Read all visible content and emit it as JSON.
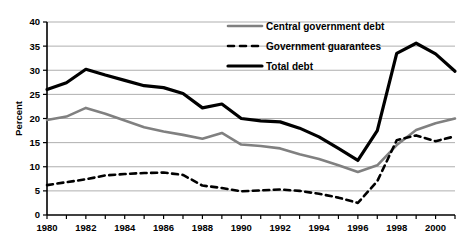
{
  "chart_data": {
    "type": "line",
    "title": "",
    "xlabel": "",
    "ylabel": "Percent",
    "xlim": [
      1980,
      2001
    ],
    "ylim": [
      0,
      40
    ],
    "ytick_step": 5,
    "xtick_step": 1,
    "xlabel_step": 2,
    "grid": true,
    "legend_position": "top-right",
    "yticks": [
      "0",
      "5",
      "10",
      "15",
      "20",
      "25",
      "30",
      "35",
      "40"
    ],
    "x": [
      1980,
      1981,
      1982,
      1983,
      1984,
      1985,
      1986,
      1987,
      1988,
      1989,
      1990,
      1991,
      1992,
      1993,
      1994,
      1995,
      1996,
      1997,
      1998,
      1999,
      2000,
      2001
    ],
    "xticklabels": [
      "1980",
      "",
      "1982",
      "",
      "1984",
      "",
      "1986",
      "",
      "1988",
      "",
      "1990",
      "",
      "1992",
      "",
      "1994",
      "",
      "1996",
      "",
      "1998",
      "",
      "2000",
      ""
    ],
    "xticklabels_shown": [
      "1980",
      "1982",
      "1984",
      "1986",
      "1988",
      "1990",
      "1992",
      "1994",
      "1996",
      "1998",
      "2000"
    ],
    "series": [
      {
        "name": "Central government debt",
        "style": "solid",
        "color": "#808080",
        "width": 2.6,
        "values": [
          19.7,
          20.4,
          22.2,
          21.0,
          19.6,
          18.2,
          17.3,
          16.6,
          15.8,
          17.0,
          14.6,
          14.3,
          13.8,
          12.6,
          11.6,
          10.3,
          8.9,
          10.3,
          14.5,
          17.6,
          19.0,
          20.0
        ]
      },
      {
        "name": "Government guarantees",
        "style": "dashed",
        "color": "#000000",
        "width": 2.6,
        "values": [
          6.2,
          6.8,
          7.4,
          8.2,
          8.5,
          8.7,
          8.8,
          8.3,
          6.1,
          5.6,
          4.9,
          5.1,
          5.3,
          5.0,
          4.4,
          3.6,
          2.5,
          7.0,
          15.5,
          16.5,
          15.3,
          16.3
        ]
      },
      {
        "name": "Total debt",
        "style": "solid",
        "color": "#000000",
        "width": 3.2,
        "values": [
          26.0,
          27.4,
          30.2,
          29.0,
          27.9,
          26.8,
          26.4,
          25.2,
          22.2,
          23.0,
          20.0,
          19.5,
          19.3,
          18.0,
          16.2,
          13.8,
          11.3,
          17.5,
          33.5,
          35.6,
          33.4,
          29.8
        ]
      }
    ]
  },
  "legend": {
    "items": [
      {
        "label": "Central government debt",
        "color": "#808080",
        "style": "solid"
      },
      {
        "label": "Government guarantees",
        "color": "#000000",
        "style": "dashed"
      },
      {
        "label": "Total debt",
        "color": "#000000",
        "style": "solid"
      }
    ]
  }
}
